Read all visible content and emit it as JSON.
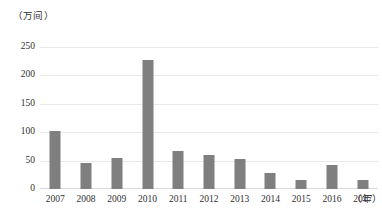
{
  "chart_data": {
    "type": "bar",
    "title": "",
    "subtitle": "",
    "xlabel": "（年）",
    "ylabel": "（万间）",
    "categories": [
      "2007",
      "2008",
      "2009",
      "2010",
      "2011",
      "2012",
      "2013",
      "2014",
      "2015",
      "2016",
      "2017"
    ],
    "values": [
      103,
      45,
      55,
      228,
      67,
      60,
      53,
      29,
      16,
      43,
      15
    ],
    "series": [
      {
        "name": "",
        "values": [
          103,
          45,
          55,
          228,
          67,
          60,
          53,
          29,
          16,
          43,
          15
        ]
      }
    ],
    "ylim": [
      0,
      250
    ],
    "y_ticks": [
      0,
      50,
      100,
      150,
      200,
      250
    ],
    "y_tick_labels": [
      "0",
      "50",
      "100",
      "150",
      "200",
      "250"
    ],
    "grid": true,
    "grid_axis": "y",
    "legend": false,
    "legend_position": "none",
    "bar_color": "#7f7f7f",
    "gridline_color": "#e8e8e8",
    "axis_color": "#d9d9d9",
    "text_color": "#303030",
    "background": "#ffffff"
  }
}
